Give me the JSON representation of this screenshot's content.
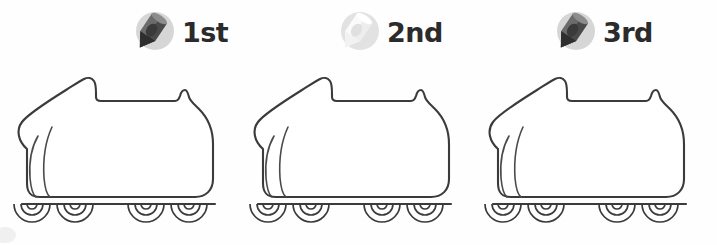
{
  "page": {
    "background_color": "#fefefe",
    "outline_color": "#3b3b3b",
    "text_color": "#2b2b2b",
    "width": 717,
    "height": 245
  },
  "items": [
    {
      "ordinal": "1st",
      "icon_name": "pen-icon",
      "icon_label": "dark pen",
      "icon_body_color": "#6b6b6b",
      "icon_shade_color": "#4a4a4a",
      "icon_tip_color": "#303030",
      "icon_circle_color": "#d6d6d6",
      "subject_name": "inline-skate",
      "subject_label": "inline skate outline",
      "wheel_count": 4
    },
    {
      "ordinal": "2nd",
      "icon_name": "pen-icon",
      "icon_label": "white pen",
      "icon_body_color": "#fafafa",
      "icon_shade_color": "#e8e8e8",
      "icon_tip_color": "#f2f2f2",
      "icon_circle_color": "#e2e2e2",
      "subject_name": "inline-skate",
      "subject_label": "inline skate outline",
      "wheel_count": 4
    },
    {
      "ordinal": "3rd",
      "icon_name": "pen-icon",
      "icon_label": "dark pen",
      "icon_body_color": "#6b6b6b",
      "icon_shade_color": "#4a4a4a",
      "icon_tip_color": "#303030",
      "icon_circle_color": "#d6d6d6",
      "subject_name": "inline-skate",
      "subject_label": "inline skate outline",
      "wheel_count": 4
    }
  ]
}
